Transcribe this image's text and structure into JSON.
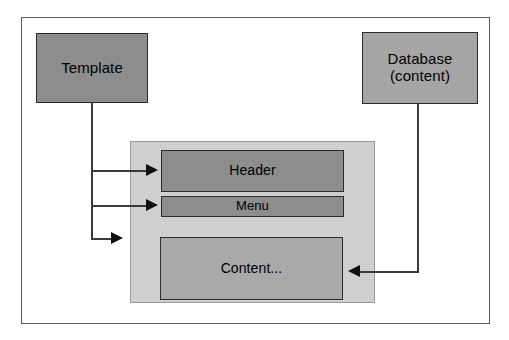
{
  "diagram": {
    "frame": {
      "name": "outer-frame"
    },
    "nodes": {
      "template": {
        "label": "Template",
        "fill": "#8d8d8d",
        "border": "#2b2b2b"
      },
      "database": {
        "label_line1": "Database",
        "label_line2": "(content)",
        "fill": "#a6a6a6",
        "border": "#2b2b2b"
      },
      "page_panel": {
        "label": "",
        "fill": "#cfcfcf",
        "border": "#9a9a9a"
      },
      "header": {
        "label": "Header",
        "fill": "#8d8d8d",
        "border": "#2b2b2b"
      },
      "menu": {
        "label": "Menu",
        "fill": "#8d8d8d",
        "border": "#2b2b2b"
      },
      "content": {
        "label": "Content...",
        "fill": "#a9a9a9",
        "border": "#2b2b2b"
      }
    },
    "connectors": [
      {
        "name": "template-to-header",
        "from": "template",
        "to": "header",
        "direction": "right"
      },
      {
        "name": "template-to-menu",
        "from": "template",
        "to": "menu",
        "direction": "right"
      },
      {
        "name": "template-to-page",
        "from": "template",
        "to": "page_panel",
        "direction": "right"
      },
      {
        "name": "database-to-content",
        "from": "database",
        "to": "content",
        "direction": "left"
      }
    ],
    "colors": {
      "background": "#ffffff",
      "line": "#3a3a3a",
      "arrow": "#111111",
      "text": "#000000"
    }
  }
}
